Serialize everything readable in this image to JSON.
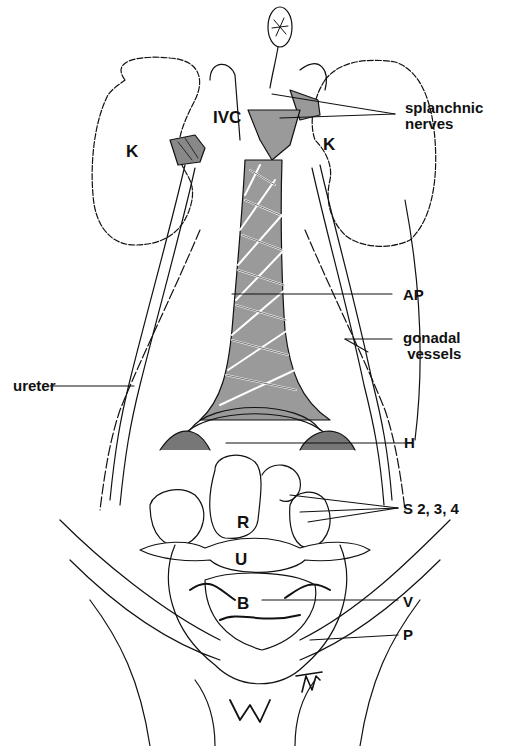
{
  "figure": {
    "artist_signature": "JMT"
  },
  "labels": {
    "splanchnic": "splanchnic\nnerves",
    "ivc": "IVC",
    "kidney_left": "K",
    "kidney_right": "K",
    "ap": "AP",
    "gonadal": "gonadal\n vessels",
    "ureter": "ureter",
    "h": "H",
    "s234": "S 2, 3, 4",
    "r": "R",
    "u": "U",
    "b": "B",
    "v": "V",
    "p": "P"
  },
  "colors": {
    "ink": "#111111",
    "plexus_fill": "#8a8a8a",
    "background": "#ffffff"
  }
}
